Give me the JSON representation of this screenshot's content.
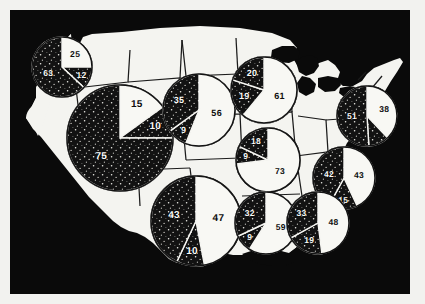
{
  "figure": {
    "kind": "choropleth-pie-map",
    "region": "United States",
    "background_color": "#0a0a0a",
    "land_color": "#f4f4f0",
    "paper_color": "#f2f2ef",
    "slice_dark_color": "#121212",
    "slice_light_color": "#f8f8f4"
  },
  "chart_data": {
    "type": "pie",
    "title": "",
    "subtitle": "",
    "xlabel": "",
    "ylabel": "",
    "legend_position": "none",
    "grid": false,
    "note": "Ten regional pie charts overlaid on a silhouette map of the contiguous United States. Each pie is divided into shaded (dark, stippled) and unshaded (light) wedges labelled with percentages.",
    "charts": [
      {
        "id": "pacific-northwest",
        "region": "Pacific Northwest",
        "center_x": 52,
        "center_y": 57,
        "radius": 30,
        "start_angle": -90,
        "slices": [
          {
            "label": "25",
            "value": 25,
            "fill": "light"
          },
          {
            "label": "12",
            "value": 12,
            "fill": "dark"
          },
          {
            "label": "63",
            "value": 63,
            "fill": "dark"
          }
        ]
      },
      {
        "id": "far-west",
        "region": "Far West / Mountain",
        "center_x": 110,
        "center_y": 128,
        "radius": 53,
        "start_angle": -90,
        "slices": [
          {
            "label": "15",
            "value": 15,
            "fill": "light"
          },
          {
            "label": "10",
            "value": 10,
            "fill": "dark"
          },
          {
            "label": "75",
            "value": 75,
            "fill": "dark"
          }
        ]
      },
      {
        "id": "northern-plains",
        "region": "Northern Plains",
        "center_x": 189,
        "center_y": 100,
        "radius": 36,
        "start_angle": -90,
        "slices": [
          {
            "label": "56",
            "value": 56,
            "fill": "light"
          },
          {
            "label": "9",
            "value": 9,
            "fill": "dark"
          },
          {
            "label": "35",
            "value": 35,
            "fill": "dark"
          }
        ]
      },
      {
        "id": "upper-midwest",
        "region": "Upper Midwest",
        "center_x": 254,
        "center_y": 80,
        "radius": 33,
        "start_angle": -90,
        "slices": [
          {
            "label": "61",
            "value": 61,
            "fill": "light"
          },
          {
            "label": "19",
            "value": 19,
            "fill": "dark"
          },
          {
            "label": "20",
            "value": 20,
            "fill": "dark"
          }
        ]
      },
      {
        "id": "ohio-valley",
        "region": "Ohio Valley",
        "center_x": 258,
        "center_y": 150,
        "radius": 32,
        "start_angle": -90,
        "slices": [
          {
            "label": "73",
            "value": 73,
            "fill": "light"
          },
          {
            "label": "9",
            "value": 9,
            "fill": "dark"
          },
          {
            "label": "18",
            "value": 18,
            "fill": "dark"
          }
        ]
      },
      {
        "id": "northeast",
        "region": "Northeast",
        "center_x": 357,
        "center_y": 106,
        "radius": 30,
        "start_angle": -90,
        "slices": [
          {
            "label": "38",
            "value": 38,
            "fill": "light"
          },
          {
            "label": "",
            "value": 11,
            "fill": "dark"
          },
          {
            "label": "51",
            "value": 51,
            "fill": "dark"
          }
        ]
      },
      {
        "id": "south-atlantic",
        "region": "South Atlantic",
        "center_x": 334,
        "center_y": 168,
        "radius": 31,
        "start_angle": -90,
        "slices": [
          {
            "label": "43",
            "value": 43,
            "fill": "light"
          },
          {
            "label": "15",
            "value": 15,
            "fill": "dark"
          },
          {
            "label": "42",
            "value": 42,
            "fill": "dark"
          }
        ]
      },
      {
        "id": "southwest",
        "region": "Southwest",
        "center_x": 186,
        "center_y": 211,
        "radius": 45,
        "start_angle": -90,
        "slices": [
          {
            "label": "47",
            "value": 47,
            "fill": "light"
          },
          {
            "label": "10",
            "value": 10,
            "fill": "dark"
          },
          {
            "label": "43",
            "value": 43,
            "fill": "dark"
          }
        ]
      },
      {
        "id": "south-central",
        "region": "South Central",
        "center_x": 256,
        "center_y": 213,
        "radius": 31,
        "start_angle": -90,
        "slices": [
          {
            "label": "59",
            "value": 59,
            "fill": "light"
          },
          {
            "label": "9",
            "value": 9,
            "fill": "dark"
          },
          {
            "label": "32",
            "value": 32,
            "fill": "dark"
          }
        ]
      },
      {
        "id": "southeast",
        "region": "Southeast",
        "center_x": 308,
        "center_y": 213,
        "radius": 31,
        "start_angle": -90,
        "slices": [
          {
            "label": "48",
            "value": 48,
            "fill": "light"
          },
          {
            "label": "19",
            "value": 19,
            "fill": "dark"
          },
          {
            "label": "33",
            "value": 33,
            "fill": "dark"
          }
        ]
      }
    ]
  }
}
